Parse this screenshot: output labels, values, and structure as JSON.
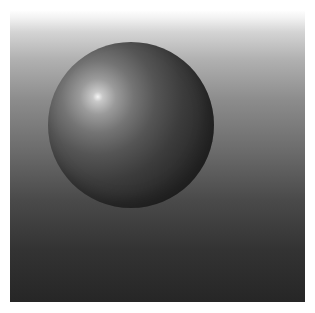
{
  "scene": {
    "description": "Rendered 3D glossy sphere on vertical gradient background",
    "background": {
      "top_color": "#ffffff",
      "bottom_color": "#262626"
    },
    "sphere": {
      "center": [
        131,
        125
      ],
      "radius": 83,
      "highlight_position": [
        98,
        104
      ],
      "highlight_color": "#f4f4f4",
      "shadow_color": "#232323"
    }
  }
}
